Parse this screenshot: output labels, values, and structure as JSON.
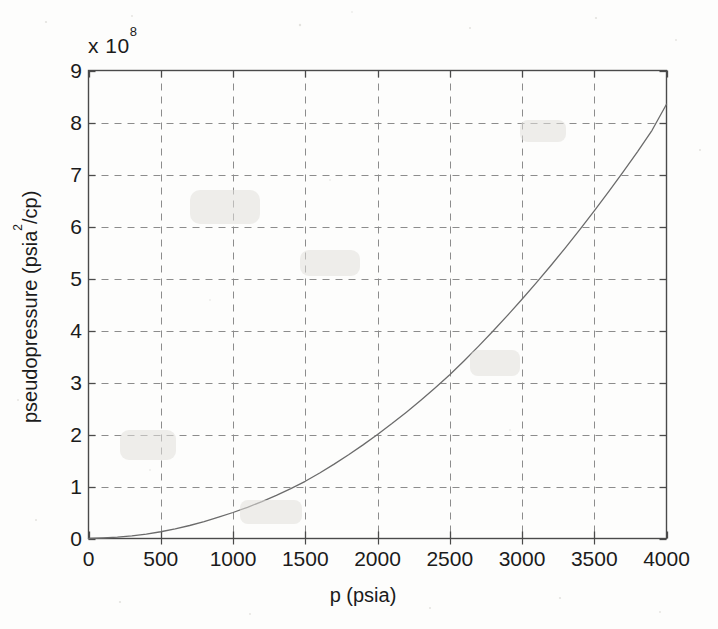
{
  "chart_data": {
    "type": "line",
    "title": "",
    "xlabel": "p (psia)",
    "ylabel": "pseudopressure (psia²/cp)",
    "ylabel_base": "pseudopressure (psia",
    "ylabel_sup": "2",
    "ylabel_tail": "/cp)",
    "y_exponent_prefix": "x 10",
    "y_exponent_power": "8",
    "y_axis_multiplier": 100000000,
    "xlim": [
      0,
      4000
    ],
    "ylim": [
      0,
      9
    ],
    "xticks": [
      0,
      500,
      1000,
      1500,
      2000,
      2500,
      3000,
      3500,
      4000
    ],
    "xtick_labels": [
      "0",
      "500",
      "1000",
      "1500",
      "2000",
      "2500",
      "3000",
      "3500",
      "4000"
    ],
    "yticks": [
      0,
      1,
      2,
      3,
      4,
      5,
      6,
      7,
      8,
      9
    ],
    "ytick_labels": [
      "0",
      "1",
      "2",
      "3",
      "4",
      "5",
      "6",
      "7",
      "8",
      "9"
    ],
    "grid": true,
    "grid_style": "dashed",
    "grid_color": "#8c8c8c",
    "axis_color": "#4a4a4a",
    "line_color": "#6b6b6b",
    "line_width": 1.3,
    "legend": null,
    "series": [
      {
        "name": "pseudopressure",
        "x": [
          0,
          100,
          200,
          300,
          400,
          500,
          600,
          700,
          800,
          900,
          1000,
          1100,
          1200,
          1300,
          1400,
          1500,
          1600,
          1700,
          1800,
          1900,
          2000,
          2100,
          2200,
          2300,
          2400,
          2500,
          2600,
          2700,
          2800,
          2900,
          3000,
          3100,
          3200,
          3300,
          3400,
          3500,
          3600,
          3700,
          3800,
          3900,
          4000
        ],
        "y": [
          0.0,
          0.01,
          0.025,
          0.05,
          0.085,
          0.13,
          0.185,
          0.25,
          0.325,
          0.41,
          0.5,
          0.6,
          0.71,
          0.83,
          0.96,
          1.1,
          1.26,
          1.43,
          1.61,
          1.8,
          2.0,
          2.21,
          2.43,
          2.66,
          2.9,
          3.15,
          3.42,
          3.7,
          3.99,
          4.29,
          4.6,
          4.92,
          5.25,
          5.59,
          5.94,
          6.3,
          6.67,
          7.05,
          7.44,
          7.85,
          8.35
        ]
      }
    ]
  }
}
